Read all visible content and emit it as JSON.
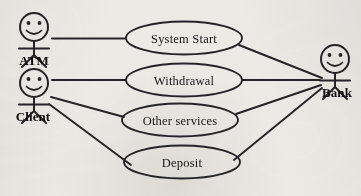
{
  "diagram": {
    "kind": "uml-use-case-diagram",
    "width": 361,
    "height": 196,
    "background_color": "#eceae5",
    "ink_color": "#232327"
  },
  "actors": [
    {
      "id": "atm",
      "label": "ATM",
      "position": {
        "x": 34,
        "y": 40
      },
      "label_position": {
        "x": 34,
        "y": 63
      }
    },
    {
      "id": "client",
      "label": "Client",
      "position": {
        "x": 34,
        "y": 96
      },
      "label_position": {
        "x": 33,
        "y": 119
      }
    },
    {
      "id": "bank",
      "label": "Bank",
      "position": {
        "x": 334,
        "y": 71
      },
      "label_position": {
        "x": 336,
        "y": 95
      }
    }
  ],
  "use_cases": [
    {
      "id": "system-start",
      "label": "System Start",
      "center": {
        "x": 184,
        "y": 38
      },
      "radius": {
        "rx": 58,
        "ry": 16
      }
    },
    {
      "id": "withdrawal",
      "label": "Withdrawal",
      "center": {
        "x": 184,
        "y": 80
      },
      "radius": {
        "rx": 58,
        "ry": 16
      }
    },
    {
      "id": "other-services",
      "label": "Other services",
      "center": {
        "x": 180,
        "y": 120
      },
      "radius": {
        "rx": 58,
        "ry": 16
      }
    },
    {
      "id": "deposit",
      "label": "Deposit",
      "center": {
        "x": 182,
        "y": 162
      },
      "radius": {
        "rx": 58,
        "ry": 16
      }
    }
  ],
  "associations": [
    {
      "id": "atm-system-start",
      "from": "atm",
      "to": "system-start",
      "points": "52,38 126,38"
    },
    {
      "id": "client-withdrawal",
      "from": "client",
      "to": "withdrawal",
      "points": "52,80 126,80"
    },
    {
      "id": "client-other-services",
      "from": "client",
      "to": "other-services",
      "points": "52,98 124,118"
    },
    {
      "id": "client-deposit",
      "from": "client",
      "to": "deposit",
      "points": "50,104 130,165"
    },
    {
      "id": "system-start-bank",
      "from": "system-start",
      "to": "bank",
      "points": "240,45 322,78"
    },
    {
      "id": "withdrawal-bank",
      "from": "withdrawal",
      "to": "bank",
      "points": "242,80 320,80"
    },
    {
      "id": "other-services-bank",
      "from": "other-services",
      "to": "bank",
      "points": "236,114 321,85"
    },
    {
      "id": "deposit-bank",
      "from": "deposit",
      "to": "bank",
      "points": "235,160 322,88"
    }
  ]
}
